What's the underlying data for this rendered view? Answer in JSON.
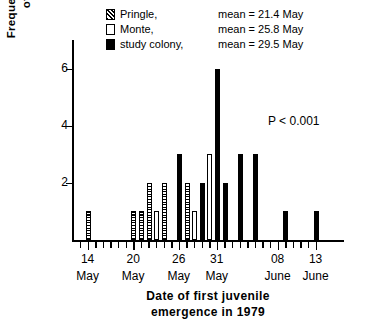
{
  "chart_data": {
    "type": "bar",
    "title": "",
    "xlabel": "Date of first juvenile emergence in 1979",
    "ylabel": "Frequency (number of litters)",
    "ylim": [
      0,
      7
    ],
    "yticks": [
      2,
      4,
      6
    ],
    "grid": false,
    "annotation": "P < 0.001",
    "legend_position": "top-center",
    "x_axis_note": "Daily tick marks from 13 May to 14 June 1979",
    "xticks_labeled": [
      {
        "day": "14",
        "month": "May",
        "index": 1
      },
      {
        "day": "20",
        "month": "May",
        "index": 7
      },
      {
        "day": "26",
        "month": "May",
        "index": 13
      },
      {
        "day": "31",
        "month": "May",
        "index": 18
      },
      {
        "day": "08",
        "month": "June",
        "index": 26
      },
      {
        "day": "13",
        "month": "June",
        "index": 31
      }
    ],
    "series": [
      {
        "name": "Pringle",
        "mean_label": "mean = 21.4 May",
        "fill": "hatched",
        "values": [
          {
            "index": 1,
            "date": "14 May",
            "value": 1
          },
          {
            "index": 7,
            "date": "20 May",
            "value": 1
          },
          {
            "index": 8,
            "date": "21 May",
            "value": 1
          },
          {
            "index": 9,
            "date": "22 May",
            "value": 2
          },
          {
            "index": 11,
            "date": "24 May",
            "value": 2
          },
          {
            "index": 14,
            "date": "27 May",
            "value": 2
          }
        ]
      },
      {
        "name": "Monte",
        "mean_label": "mean = 25.8 May",
        "fill": "white",
        "values": [
          {
            "index": 10,
            "date": "23 May",
            "value": 1
          },
          {
            "index": 15,
            "date": "28 May",
            "value": 1
          },
          {
            "index": 17,
            "date": "30 May",
            "value": 3
          }
        ]
      },
      {
        "name": "study colony",
        "mean_label": "mean = 29.5 May",
        "fill": "black",
        "values": [
          {
            "index": 13,
            "date": "26 May",
            "value": 3
          },
          {
            "index": 16,
            "date": "29 May",
            "value": 2
          },
          {
            "index": 18,
            "date": "31 May",
            "value": 6
          },
          {
            "index": 19,
            "date": "01 June",
            "value": 2
          },
          {
            "index": 21,
            "date": "03 June",
            "value": 3
          },
          {
            "index": 23,
            "date": "05 June",
            "value": 3
          },
          {
            "index": 27,
            "date": "09 June",
            "value": 1
          },
          {
            "index": 31,
            "date": "13 June",
            "value": 1
          }
        ]
      }
    ],
    "bars": [
      {
        "index": 1,
        "value": 1,
        "fill": "hatched"
      },
      {
        "index": 7,
        "value": 1,
        "fill": "hatched"
      },
      {
        "index": 8,
        "value": 1,
        "fill": "hatched"
      },
      {
        "index": 9,
        "value": 2,
        "fill": "hatched"
      },
      {
        "index": 10,
        "value": 1,
        "fill": "white"
      },
      {
        "index": 11,
        "value": 2,
        "fill": "hatched"
      },
      {
        "index": 13,
        "value": 3,
        "fill": "black"
      },
      {
        "index": 14,
        "value": 2,
        "fill": "hatched"
      },
      {
        "index": 15,
        "value": 1,
        "fill": "white"
      },
      {
        "index": 16,
        "value": 2,
        "fill": "black"
      },
      {
        "index": 17,
        "value": 3,
        "fill": "white"
      },
      {
        "index": 18,
        "value": 6,
        "fill": "black"
      },
      {
        "index": 19,
        "value": 2,
        "fill": "black"
      },
      {
        "index": 21,
        "value": 3,
        "fill": "black"
      },
      {
        "index": 23,
        "value": 3,
        "fill": "black"
      },
      {
        "index": 27,
        "value": 1,
        "fill": "black"
      },
      {
        "index": 31,
        "value": 1,
        "fill": "black"
      }
    ]
  },
  "legend": {
    "rows": [
      {
        "label": "Pringle,",
        "mean": "mean = 21.4 May",
        "fill": "hatched"
      },
      {
        "label": "Monte,",
        "mean": "mean = 25.8 May",
        "fill": "white"
      },
      {
        "label": "study colony,",
        "mean": "mean = 29.5 May",
        "fill": "black"
      }
    ]
  },
  "axes": {
    "y_title_line1": "Frequency  (number",
    "y_title_line2": "of  litters)",
    "x_title_line1": "Date of first juvenile",
    "x_title_line2": "emergence  in  1979"
  },
  "annotation": {
    "pvalue": "P < 0.001"
  }
}
